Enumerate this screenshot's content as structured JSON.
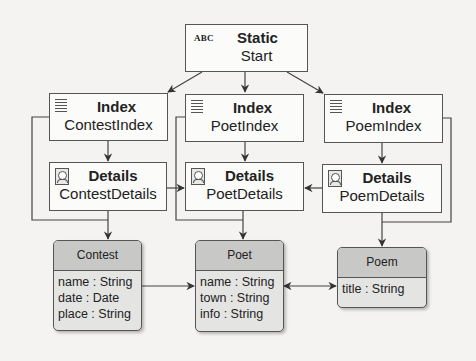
{
  "diagram": {
    "type": "navigation-model",
    "start": {
      "stereotype_icon": "ABC",
      "kind": "Static",
      "name": "Start"
    },
    "index_nodes": [
      {
        "kind": "Index",
        "name": "ContestIndex",
        "icon": "list-icon"
      },
      {
        "kind": "Index",
        "name": "PoetIndex",
        "icon": "list-icon"
      },
      {
        "kind": "Index",
        "name": "PoemIndex",
        "icon": "list-icon"
      }
    ],
    "details_nodes": [
      {
        "kind": "Details",
        "name": "ContestDetails",
        "icon": "details-icon"
      },
      {
        "kind": "Details",
        "name": "PoetDetails",
        "icon": "details-icon"
      },
      {
        "kind": "Details",
        "name": "PoemDetails",
        "icon": "details-icon"
      }
    ],
    "classes": [
      {
        "name": "Contest",
        "attributes": [
          "name : String",
          "date : Date",
          "place : String"
        ]
      },
      {
        "name": "Poet",
        "attributes": [
          "name : String",
          "town : String",
          "info : String"
        ]
      },
      {
        "name": "Poem",
        "attributes": [
          "title : String"
        ]
      }
    ],
    "edges": [
      {
        "from": "Start",
        "to": "ContestIndex"
      },
      {
        "from": "Start",
        "to": "PoetIndex"
      },
      {
        "from": "Start",
        "to": "PoemIndex"
      },
      {
        "from": "ContestIndex",
        "to": "ContestDetails"
      },
      {
        "from": "PoetIndex",
        "to": "PoetDetails"
      },
      {
        "from": "PoemIndex",
        "to": "PoemDetails"
      },
      {
        "from": "ContestDetails",
        "to": "PoetDetails"
      },
      {
        "from": "PoemDetails",
        "to": "PoetDetails"
      },
      {
        "from": "ContestIndex",
        "to": "Contest"
      },
      {
        "from": "ContestDetails",
        "to": "Contest"
      },
      {
        "from": "PoetIndex",
        "to": "Poet"
      },
      {
        "from": "PoetDetails",
        "to": "Poet"
      },
      {
        "from": "PoemIndex",
        "to": "Poem"
      },
      {
        "from": "PoemDetails",
        "to": "Poem"
      },
      {
        "from": "Contest",
        "to": "Poet"
      },
      {
        "from": "Poet",
        "to": "Poem",
        "bidirectional": true
      }
    ]
  }
}
